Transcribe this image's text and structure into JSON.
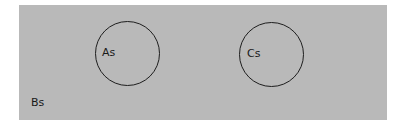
{
  "diagram": {
    "type": "venn",
    "universe": {
      "label": "Bs",
      "color": "#b9b9b9"
    },
    "sets": [
      {
        "label": "As"
      },
      {
        "label": "Cs"
      }
    ],
    "stroke_color": "#1e1e1e"
  }
}
